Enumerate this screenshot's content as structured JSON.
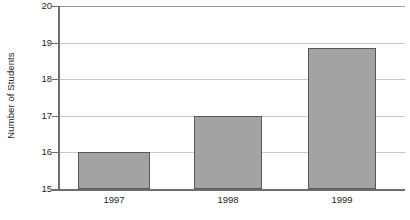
{
  "chart_data": {
    "type": "bar",
    "title": "",
    "xlabel": "",
    "ylabel": "Number of Students",
    "categories": [
      "1997",
      "1998",
      "1999"
    ],
    "values": [
      16.0,
      17.0,
      18.85
    ],
    "ylim": [
      15,
      20
    ],
    "yticks": [
      15,
      16,
      17,
      18,
      19,
      20
    ],
    "ytick_labels": [
      "15",
      "16",
      "17",
      "18",
      "19",
      "20"
    ],
    "grid": "horizontal",
    "legend": "none",
    "colors": {
      "bar_fill": "#a3a3a3",
      "bar_border": "#575757",
      "gridline": "#c9c9c9",
      "axis": "#6d6d6d",
      "text": "#231f20",
      "background": "#ffffff"
    }
  }
}
